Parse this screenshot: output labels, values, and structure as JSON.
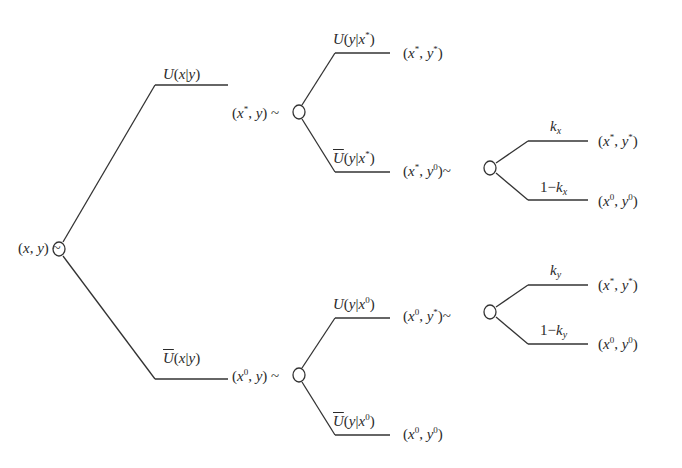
{
  "diagram": {
    "type": "decision-tree",
    "line_color": "#333333",
    "root": {
      "label": "(x, y) ~"
    },
    "level1": {
      "upper": {
        "edge_label": "U(x|y)",
        "node_label": "(x*, y) ~"
      },
      "lower": {
        "edge_label": "Ū(x|y)",
        "node_label": "(x⁰, y) ~"
      }
    },
    "level2": {
      "upper_upper": {
        "edge_label": "U(y|x*)",
        "outcome": "(x*, y*)"
      },
      "upper_lower": {
        "edge_label": "Ū(y|x*)",
        "node_label": "(x*, y⁰)~"
      },
      "lower_upper": {
        "edge_label": "U(y|x⁰)",
        "node_label": "(x⁰, y*)~"
      },
      "lower_lower": {
        "edge_label": "Ū(y|x⁰)",
        "outcome": "(x⁰, y⁰)"
      }
    },
    "level3": {
      "kx": {
        "edge_label": "k_x",
        "outcome": "(x*, y*)"
      },
      "one_minus_kx": {
        "edge_label": "1−k_x",
        "outcome": "(x⁰, y⁰)"
      },
      "ky": {
        "edge_label": "k_y",
        "outcome": "(x*, y*)"
      },
      "one_minus_ky": {
        "edge_label": "1−k_y",
        "outcome": "(x⁰, y⁰)"
      }
    },
    "text": {
      "U": "U",
      "x": "x",
      "y": "y",
      "star": "*",
      "zero": "0",
      "k": "k",
      "one_minus": "1−",
      "tilde": "~",
      "bar": "|",
      "lp": "(",
      "rp": ")",
      "comma": ", "
    }
  }
}
